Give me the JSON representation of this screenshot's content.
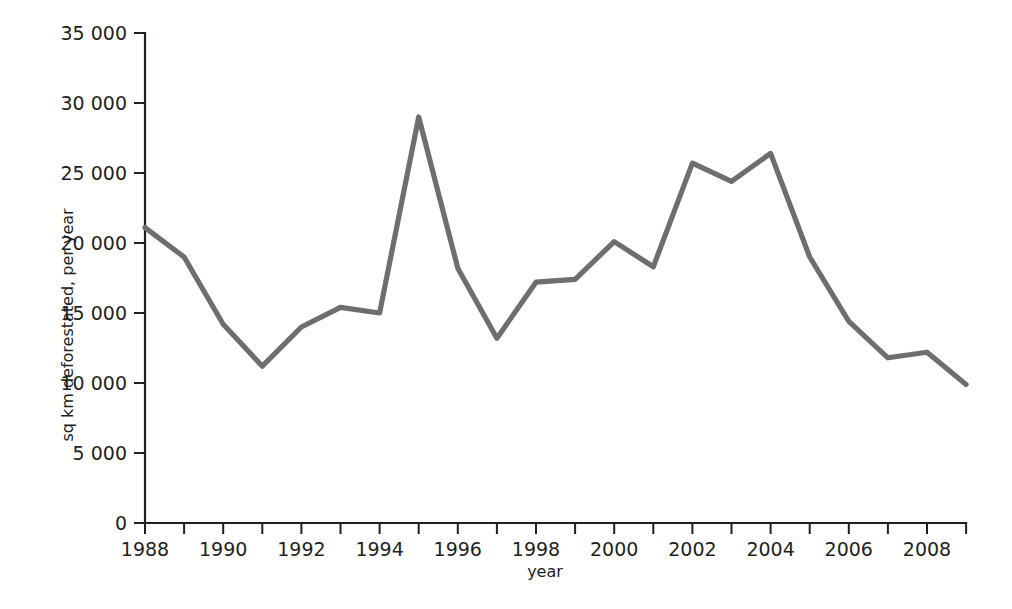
{
  "chart_data": {
    "type": "line",
    "title": "",
    "subtitle": "",
    "xlabel": "year",
    "ylabel": "sq km deforestated, per year",
    "xlim": [
      1988,
      2009
    ],
    "ylim": [
      0,
      35000
    ],
    "grid": false,
    "legend": false,
    "legend_position": "none",
    "line_color": "#6e6e6e",
    "axis_color": "#231f20",
    "x_tick_interval": 1,
    "x_label_interval": 2,
    "y_tick_interval": 5000,
    "x": [
      1988,
      1989,
      1990,
      1991,
      1992,
      1993,
      1994,
      1995,
      1996,
      1997,
      1998,
      1999,
      2000,
      2001,
      2002,
      2003,
      2004,
      2005,
      2006,
      2007,
      2008,
      2009
    ],
    "values": [
      21100,
      19000,
      14200,
      11200,
      14000,
      15400,
      15000,
      29000,
      18200,
      13200,
      17200,
      17400,
      20100,
      18300,
      25700,
      24400,
      26400,
      19000,
      14400,
      11800,
      12200,
      9900
    ],
    "x_tick_labels": [
      "1988",
      "",
      "1990",
      "",
      "1992",
      "",
      "1994",
      "",
      "1996",
      "",
      "1998",
      "",
      "2000",
      "",
      "2002",
      "",
      "2004",
      "",
      "2006",
      "",
      "2008",
      ""
    ],
    "y_tick_labels": [
      "0",
      "5 000",
      "10 000",
      "15 000",
      "20 000",
      "25 000",
      "30 000",
      "35 000"
    ],
    "y_tick_values": [
      0,
      5000,
      10000,
      15000,
      20000,
      25000,
      30000,
      35000
    ]
  }
}
